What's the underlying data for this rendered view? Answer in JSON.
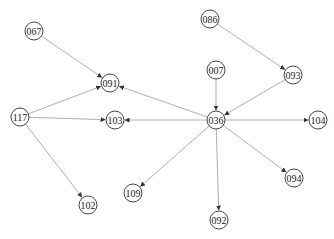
{
  "diagram": {
    "type": "directed-graph",
    "nodes": [
      {
        "id": "067",
        "label": "067",
        "x": 34,
        "y": 31
      },
      {
        "id": "091",
        "label": "091",
        "x": 110,
        "y": 83
      },
      {
        "id": "086",
        "label": "086",
        "x": 210,
        "y": 19
      },
      {
        "id": "093",
        "label": "093",
        "x": 293,
        "y": 75
      },
      {
        "id": "007",
        "label": "007",
        "x": 216,
        "y": 70
      },
      {
        "id": "117",
        "label": "117",
        "x": 20,
        "y": 117
      },
      {
        "id": "103",
        "label": "103",
        "x": 115,
        "y": 120
      },
      {
        "id": "036",
        "label": "036",
        "x": 216,
        "y": 120
      },
      {
        "id": "104",
        "label": "104",
        "x": 318,
        "y": 120
      },
      {
        "id": "109",
        "label": "109",
        "x": 133,
        "y": 193
      },
      {
        "id": "102",
        "label": "102",
        "x": 88,
        "y": 205
      },
      {
        "id": "094",
        "label": "094",
        "x": 294,
        "y": 178
      },
      {
        "id": "092",
        "label": "092",
        "x": 219,
        "y": 220
      }
    ],
    "edges": [
      {
        "from": "067",
        "to": "091"
      },
      {
        "from": "117",
        "to": "091"
      },
      {
        "from": "036",
        "to": "091"
      },
      {
        "from": "117",
        "to": "103"
      },
      {
        "from": "036",
        "to": "103"
      },
      {
        "from": "117",
        "to": "102"
      },
      {
        "from": "086",
        "to": "093"
      },
      {
        "from": "093",
        "to": "036"
      },
      {
        "from": "007",
        "to": "036"
      },
      {
        "from": "036",
        "to": "104"
      },
      {
        "from": "036",
        "to": "109"
      },
      {
        "from": "036",
        "to": "092"
      },
      {
        "from": "036",
        "to": "094"
      }
    ],
    "node_radius": 9,
    "colors": {
      "edge": "#b0b0b0",
      "node_stroke": "#444444",
      "arrow": "#333333"
    }
  }
}
